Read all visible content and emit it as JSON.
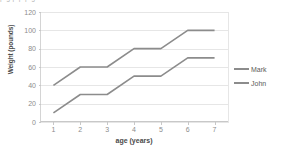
{
  "top_strip": {
    "text": "p g p p p g"
  },
  "chart_data": {
    "type": "line",
    "title": "",
    "xlabel": "age (years)",
    "ylabel": "Weight (pounds)",
    "x": [
      1,
      2,
      3,
      4,
      5,
      6,
      7
    ],
    "xtick_labels": [
      "1",
      "2",
      "3",
      "4",
      "5",
      "6",
      "7"
    ],
    "ytick_labels": [
      "0",
      "20",
      "40",
      "60",
      "80",
      "100",
      "120"
    ],
    "yticks": [
      0,
      20,
      40,
      60,
      80,
      100,
      120
    ],
    "xlim": [
      0.5,
      7.5
    ],
    "ylim": [
      0,
      120
    ],
    "grid": "horizontal",
    "legend_position": "right",
    "series": [
      {
        "name": "Mark",
        "color": "#8c8c8c",
        "values": [
          40,
          60,
          60,
          80,
          80,
          100,
          100
        ]
      },
      {
        "name": "John",
        "color": "#8c8c8c",
        "values": [
          10,
          30,
          30,
          50,
          50,
          70,
          70
        ]
      }
    ]
  }
}
